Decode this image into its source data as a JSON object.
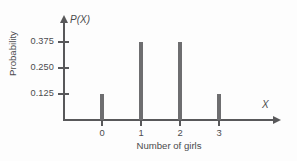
{
  "chart_data": {
    "type": "bar",
    "title": "",
    "subtitle": "",
    "xlabel": "Number of girls",
    "ylabel": "Probability",
    "x_variable_symbol": "X",
    "y_variable_symbol": "P(X)",
    "categories": [
      "0",
      "1",
      "2",
      "3"
    ],
    "values": [
      0.125,
      0.375,
      0.375,
      0.125
    ],
    "series": [
      {
        "name": "P(X)",
        "values": [
          0.125,
          0.375,
          0.375,
          0.125
        ]
      }
    ],
    "x_tick_labels": [
      "0",
      "1",
      "2",
      "3"
    ],
    "y_tick_labels": [
      "0.125",
      "0.250",
      "0.375"
    ],
    "y_tick_values": [
      0.125,
      0.25,
      0.375
    ],
    "xlim": [
      -0.55,
      4.5
    ],
    "ylim": [
      0,
      0.46
    ],
    "grid": false,
    "legend": false,
    "legend_position": "none",
    "bar_color": "#6e6e70",
    "axis_color": "#58585a",
    "text_color": "#4b4b4d",
    "background_color": "#fdfdfd",
    "annotations": []
  }
}
